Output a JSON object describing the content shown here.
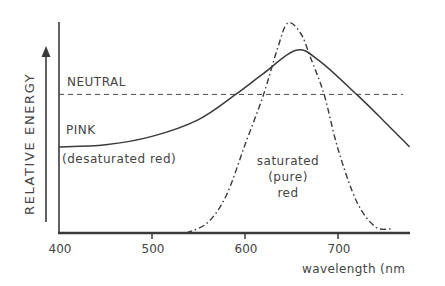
{
  "chart_data": {
    "type": "line",
    "title": "",
    "xlabel": "wavelength (nm)",
    "ylabel": "RELATIVE ENERGY",
    "xlim": [
      400,
      777
    ],
    "ylim": [
      0,
      1
    ],
    "x_ticks": [
      400,
      500,
      600,
      700
    ],
    "grid": false,
    "legend": null,
    "series": [
      {
        "name": "NEUTRAL",
        "style": "dashed",
        "points": [
          [
            400,
            0.66
          ],
          [
            770,
            0.66
          ]
        ]
      },
      {
        "name": "PINK (desaturated red)",
        "style": "solid",
        "points": [
          [
            400,
            0.41
          ],
          [
            450,
            0.42
          ],
          [
            500,
            0.46
          ],
          [
            550,
            0.54
          ],
          [
            590,
            0.66
          ],
          [
            620,
            0.76
          ],
          [
            655,
            0.87
          ],
          [
            680,
            0.82
          ],
          [
            720,
            0.66
          ],
          [
            750,
            0.53
          ],
          [
            777,
            0.41
          ]
        ]
      },
      {
        "name": "saturated (pure) red",
        "style": "dash-dot",
        "points": [
          [
            537,
            0.0
          ],
          [
            560,
            0.05
          ],
          [
            580,
            0.18
          ],
          [
            600,
            0.42
          ],
          [
            620,
            0.66
          ],
          [
            635,
            0.88
          ],
          [
            646,
            1.0
          ],
          [
            660,
            0.95
          ],
          [
            670,
            0.84
          ],
          [
            685,
            0.66
          ],
          [
            700,
            0.4
          ],
          [
            720,
            0.15
          ],
          [
            740,
            0.03
          ],
          [
            757,
            0.02
          ]
        ]
      }
    ],
    "annotations": [
      {
        "text": "NEUTRAL",
        "near": "dashed line"
      },
      {
        "text": "PINK",
        "near": "solid curve, left"
      },
      {
        "text": "(desaturated red)",
        "near": "below PINK"
      },
      {
        "text": "saturated",
        "near": "under dash-dot peak"
      },
      {
        "text": "(pure)",
        "near": "under dash-dot peak"
      },
      {
        "text": "red",
        "near": "under dash-dot peak"
      }
    ]
  },
  "labels": {
    "ylabel": "RELATIVE ENERGY",
    "xlabel": "wavelength (nm",
    "neutral": "NEUTRAL",
    "pink": "PINK",
    "pink_sub": "(desaturated red)",
    "sat_1": "saturated",
    "sat_2": "(pure)",
    "sat_3": "red",
    "ticks": [
      "400",
      "500",
      "600",
      "700"
    ]
  },
  "colors": {
    "ink": "#3a3a3a",
    "background": "#ffffff"
  }
}
